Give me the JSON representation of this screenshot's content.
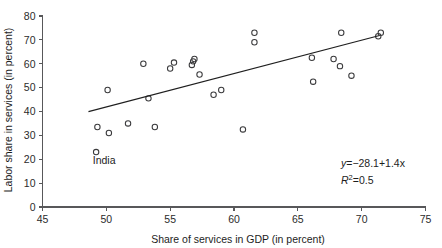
{
  "chart_data": {
    "type": "scatter",
    "title": "",
    "xlabel": "Share of services in GDP (in percent)",
    "ylabel": "Labor share in services (in percent)",
    "xlim": [
      45,
      75
    ],
    "ylim": [
      0,
      80
    ],
    "xticks": [
      45,
      50,
      55,
      60,
      65,
      70,
      75
    ],
    "yticks": [
      0,
      10,
      20,
      30,
      40,
      50,
      60,
      70,
      80
    ],
    "grid": false,
    "legend": "none",
    "x": [
      49.2,
      49.3,
      50.1,
      50.2,
      51.7,
      52.9,
      53.3,
      53.8,
      55.0,
      55.3,
      56.7,
      56.8,
      56.9,
      57.3,
      58.4,
      59.0,
      60.7,
      61.6,
      61.6,
      66.1,
      66.2,
      67.8,
      68.3,
      68.4,
      69.2,
      71.3,
      71.5
    ],
    "y": [
      23.0,
      33.5,
      49.0,
      31.0,
      35.0,
      60.0,
      45.5,
      33.5,
      58.0,
      60.5,
      59.5,
      61.0,
      62.0,
      55.5,
      47.0,
      49.0,
      32.5,
      73.0,
      69.0,
      62.5,
      52.5,
      62.0,
      59.0,
      73.0,
      55.0,
      71.5,
      73.0
    ],
    "point_labels": [
      {
        "index": 0,
        "text": "India"
      }
    ],
    "fit": {
      "equation": "y = −28.1 + 1.4x",
      "equation_y": "y",
      "equation_rhs": "=−28.1+1.4x",
      "r_squared_symbol": "R",
      "r_squared_exponent": "2",
      "r_squared_value": "=0.5",
      "slope": 1.4,
      "intercept": -28.1,
      "r2": 0.5,
      "x_start": 48.6,
      "x_end": 71.4
    },
    "colors": {
      "marker_stroke": "#3a3a3c",
      "fit_line": "#1f1f1f",
      "axis": "#58585a",
      "text": "#1d1d1d",
      "background": "#ffffff"
    }
  }
}
